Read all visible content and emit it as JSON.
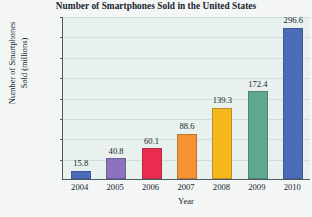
{
  "chart_data": {
    "type": "bar",
    "title": "Number of Smartphones Sold in the United States",
    "xlabel": "Year",
    "ylabel": "Number of Smartphones Sold (millions)",
    "ylabel_lines": [
      "Number of Smartphones",
      "Sold (millions)"
    ],
    "categories": [
      "2004",
      "2005",
      "2006",
      "2007",
      "2008",
      "2009",
      "2010"
    ],
    "values": [
      15.8,
      40.8,
      60.1,
      88.6,
      139.3,
      172.4,
      296.6
    ],
    "value_labels": [
      "15.8",
      "40.8",
      "60.1",
      "88.6",
      "139.3",
      "172.4",
      "296.6"
    ],
    "bar_colors": [
      "#4a6bba",
      "#8d72bf",
      "#ea2b4e",
      "#f59331",
      "#f7b81b",
      "#5da890",
      "#4a6bba"
    ],
    "ylim": [
      0,
      320
    ],
    "yticks": [
      40,
      80,
      120,
      160,
      200,
      240,
      280,
      320
    ],
    "ytick_labels": [
      "40",
      "80",
      "120",
      "160",
      "200",
      "240",
      "280",
      "320"
    ],
    "grid": true,
    "legend": "none",
    "plot_background": "#e9f2ee",
    "page_background": "#f4f7f5",
    "axis_color": "#4b5a63"
  }
}
